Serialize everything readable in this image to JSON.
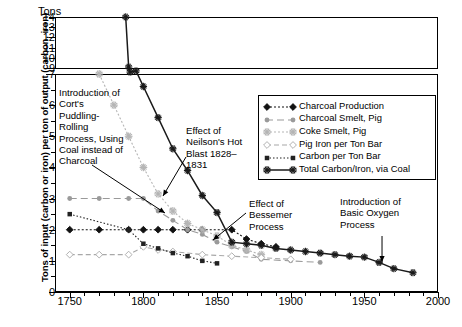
{
  "axis": {
    "y_caption": "Tons",
    "y_title": "Tons of input (carbon or iron) per ton of output (carbon, iron)",
    "y_ticks_upper": [
      "14",
      "13",
      "12",
      "11",
      "10",
      "9"
    ],
    "y_ticks_lower": [
      "7",
      "6",
      "5",
      "4",
      "3",
      "2",
      "1",
      "0"
    ],
    "x_ticks": [
      "1750",
      "1800",
      "1850",
      "1900",
      "1950",
      "2000"
    ]
  },
  "annotations": [
    {
      "name": "corts-puddling",
      "text": "Introduction of Cort's Puddling-Rolling Process, Using Coal instead of Charcoal"
    },
    {
      "name": "neilson-hot-blast",
      "text": "Effect of Neilson's Hot Blast 1828–1831"
    },
    {
      "name": "bessemer-process",
      "text": "Effect of Bessemer Process"
    },
    {
      "name": "basic-oxygen-process",
      "text": "Introduction of Basic Oxygen Process"
    }
  ],
  "legend": [
    {
      "label": "Charcoal Production",
      "color": "#111111",
      "marker": "diamond",
      "dash": "2 2"
    },
    {
      "label": "Charcoal Smelt, Pig",
      "color": "#9a9a9a",
      "marker": "dot",
      "dash": "7 4"
    },
    {
      "label": "Coke Smelt, Pig",
      "color": "#b5b5b5",
      "marker": "star",
      "dash": "2 2"
    },
    {
      "label": "Pig Iron per Ton Bar",
      "color": "#a8a8a8",
      "marker": "open-diamond",
      "dash": "5 3"
    },
    {
      "label": "Carbon per Ton Bar",
      "color": "#222222",
      "marker": "square",
      "dash": "1.5 2"
    },
    {
      "label": "Total Carbon/Iron, via Coal",
      "color": "#1a1a1a",
      "marker": "asterisk",
      "dash": "none"
    }
  ],
  "chart_data": {
    "type": "line",
    "title": "",
    "xlabel": "",
    "ylabel": "Tons of input (carbon or iron) per ton of output (carbon, iron)",
    "xlim": [
      1740,
      2000
    ],
    "ylim_lower": [
      0,
      7
    ],
    "ylim_upper": [
      9,
      14
    ],
    "broken_axis": true,
    "grid": false,
    "legend_position": "upper-right-inside",
    "series": [
      {
        "name": "Charcoal Production",
        "color": "#111111",
        "x": [
          1750,
          1770,
          1790,
          1800,
          1810,
          1820,
          1830,
          1840,
          1860,
          1870,
          1880,
          1890
        ],
        "y": [
          2.0,
          2.0,
          2.0,
          2.0,
          2.0,
          2.0,
          2.0,
          2.0,
          2.0,
          1.7,
          1.55,
          1.45
        ]
      },
      {
        "name": "Charcoal Smelt, Pig",
        "color": "#9a9a9a",
        "x": [
          1750,
          1770,
          1790,
          1800,
          1810,
          1820,
          1830,
          1840,
          1850,
          1860,
          1870,
          1880,
          1900,
          1920
        ],
        "y": [
          3.0,
          3.0,
          3.0,
          3.0,
          2.6,
          2.3,
          2.0,
          1.85,
          1.6,
          1.45,
          1.3,
          1.05,
          1.0,
          0.95
        ]
      },
      {
        "name": "Coke Smelt, Pig",
        "color": "#b5b5b5",
        "x": [
          1770,
          1780,
          1790,
          1800,
          1810,
          1820,
          1830,
          1840,
          1850,
          1860,
          1870,
          1880
        ],
        "y": [
          7.0,
          6.0,
          5.0,
          4.0,
          3.15,
          2.6,
          2.2,
          2.0,
          1.8,
          1.5,
          1.35,
          1.2
        ]
      },
      {
        "name": "Pig Iron per Ton Bar",
        "color": "#a8a8a8",
        "x": [
          1750,
          1770,
          1790,
          1800,
          1810,
          1820,
          1840,
          1860,
          1880,
          1900
        ],
        "y": [
          1.2,
          1.2,
          1.2,
          1.45,
          1.35,
          1.3,
          1.2,
          1.15,
          1.1,
          1.05
        ]
      },
      {
        "name": "Carbon per Ton Bar",
        "color": "#222222",
        "x": [
          1750,
          1790,
          1800,
          1810,
          1820,
          1830,
          1840,
          1850
        ],
        "y": [
          2.5,
          2.0,
          1.55,
          1.4,
          1.25,
          1.15,
          1.0,
          0.92
        ]
      },
      {
        "name": "Total Carbon/Iron, via Coal",
        "color": "#1a1a1a",
        "x": [
          1788,
          1790,
          1791,
          1795,
          1800,
          1810,
          1820,
          1830,
          1840,
          1850,
          1860,
          1870,
          1880,
          1890,
          1900,
          1910,
          1920,
          1930,
          1940,
          1950,
          1960,
          1970,
          1983
        ],
        "y": [
          14.0,
          9.1,
          8.6,
          7.1,
          6.6,
          5.6,
          4.6,
          3.9,
          3.1,
          2.55,
          1.6,
          1.55,
          1.5,
          1.4,
          1.35,
          1.3,
          1.25,
          1.2,
          1.15,
          1.12,
          0.95,
          0.75,
          0.62
        ]
      }
    ]
  }
}
